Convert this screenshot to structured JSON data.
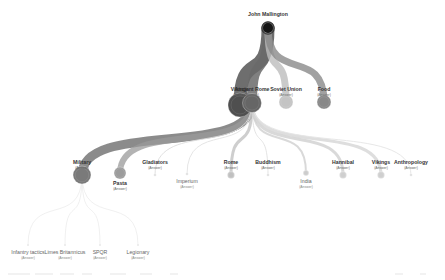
{
  "diagram": {
    "type": "tree",
    "root": {
      "name": "John Mallington",
      "x": 268,
      "y": 28,
      "r": 5,
      "label_y": 12,
      "color": "#151515"
    },
    "links": [
      {
        "from": "root",
        "to": "vikings_l1",
        "width": 13,
        "color": "#555555",
        "opacity": 0.85
      },
      {
        "from": "root",
        "to": "ancient_rome",
        "width": 10,
        "color": "#6a6a6a",
        "opacity": 0.85
      },
      {
        "from": "root",
        "to": "soviet_union",
        "width": 7,
        "color": "#bdbdbd",
        "opacity": 0.8
      },
      {
        "from": "root",
        "to": "food",
        "width": 7,
        "color": "#8a8a8a",
        "opacity": 0.8
      },
      {
        "from": "ancient_rome",
        "to": "military",
        "width": 9,
        "color": "#777777",
        "opacity": 0.85
      },
      {
        "from": "ancient_rome",
        "to": "pasta",
        "width": 6,
        "color": "#9a9a9a",
        "opacity": 0.75
      },
      {
        "from": "ancient_rome",
        "to": "gladiators",
        "width": 1,
        "color": "#dddddd",
        "opacity": 0.9
      },
      {
        "from": "ancient_rome",
        "to": "imperium",
        "width": 1,
        "color": "#e2e2e2",
        "opacity": 0.9
      },
      {
        "from": "ancient_rome",
        "to": "rome",
        "width": 3,
        "color": "#c2c2c2",
        "opacity": 0.8
      },
      {
        "from": "ancient_rome",
        "to": "buddhism",
        "width": 1,
        "color": "#e0e0e0",
        "opacity": 0.9
      },
      {
        "from": "ancient_rome",
        "to": "india",
        "width": 2,
        "color": "#d2d2d2",
        "opacity": 0.85
      },
      {
        "from": "ancient_rome",
        "to": "hannibal",
        "width": 3,
        "color": "#d0d0d0",
        "opacity": 0.8
      },
      {
        "from": "ancient_rome",
        "to": "vikings_l2",
        "width": 3,
        "color": "#d6d6d6",
        "opacity": 0.8
      },
      {
        "from": "ancient_rome",
        "to": "anthropology",
        "width": 1,
        "color": "#e4e4e4",
        "opacity": 0.9
      },
      {
        "from": "military",
        "to": "infantry_tactics",
        "width": 0.6,
        "color": "#e6e6e6",
        "opacity": 1
      },
      {
        "from": "military",
        "to": "limes_britannicus",
        "width": 0.6,
        "color": "#e6e6e6",
        "opacity": 1
      },
      {
        "from": "military",
        "to": "spqr",
        "width": 0.6,
        "color": "#e6e6e6",
        "opacity": 1
      },
      {
        "from": "military",
        "to": "legionary",
        "width": 0.6,
        "color": "#e6e6e6",
        "opacity": 1
      }
    ],
    "nodes": [
      {
        "id": "vikings_l1",
        "name": "Vikings",
        "status": "(Answer)",
        "x": 240,
        "y": 105,
        "r": 12,
        "color": "#4f4f4f",
        "label_y": 87,
        "faint": false
      },
      {
        "id": "ancient_rome",
        "name": "Ancient Rome",
        "status": "(Answer)",
        "x": 252,
        "y": 103,
        "r": 9.5,
        "color": "#666666",
        "label_y": 87,
        "faint": false
      },
      {
        "id": "soviet_union",
        "name": "Soviet Union",
        "status": "(Answer)",
        "x": 286,
        "y": 102,
        "r": 7,
        "color": "#c4c4c4",
        "label_y": 87,
        "faint": false
      },
      {
        "id": "food",
        "name": "Food",
        "status": "(Answer)",
        "x": 324,
        "y": 102,
        "r": 7,
        "color": "#888888",
        "label_y": 87,
        "faint": false
      },
      {
        "id": "military",
        "name": "Military",
        "status": "(Answer)",
        "x": 82,
        "y": 175,
        "r": 9,
        "color": "#7a7a7a",
        "label_y": 160,
        "faint": false
      },
      {
        "id": "pasta",
        "name": "Pasta",
        "status": "(Answer)",
        "x": 120,
        "y": 173,
        "r": 6,
        "color": "#9c9c9c",
        "label_y": 181,
        "faint": false,
        "label_below": true
      },
      {
        "id": "gladiators",
        "name": "Gladiators",
        "status": "(Answer)",
        "x": 155,
        "y": 175,
        "r": 1.3,
        "color": "#dddddd",
        "label_y": 160,
        "faint": false
      },
      {
        "id": "imperium",
        "name": "Imperium",
        "status": "(Answer)",
        "x": 187,
        "y": 174,
        "r": 1.3,
        "color": "#dddddd",
        "label_y": 179,
        "faint": true,
        "label_below": true
      },
      {
        "id": "rome",
        "name": "Rome",
        "status": "(Answer)",
        "x": 231,
        "y": 175,
        "r": 3.5,
        "color": "#c0c0c0",
        "label_y": 160,
        "faint": false
      },
      {
        "id": "buddhism",
        "name": "Buddhism",
        "status": "(Answer)",
        "x": 268,
        "y": 175,
        "r": 1.3,
        "color": "#dddddd",
        "label_y": 160,
        "faint": false
      },
      {
        "id": "india",
        "name": "India",
        "status": "(Answer)",
        "x": 306,
        "y": 173,
        "r": 2.8,
        "color": "#cccccc",
        "label_y": 179,
        "faint": true,
        "label_below": true
      },
      {
        "id": "hannibal",
        "name": "Hannibal",
        "status": "(Answer)",
        "x": 343,
        "y": 175,
        "r": 3.5,
        "color": "#cfcfcf",
        "label_y": 160,
        "faint": false
      },
      {
        "id": "vikings_l2",
        "name": "Vikings",
        "status": "(Answer)",
        "x": 381,
        "y": 175,
        "r": 3.5,
        "color": "#cfcfcf",
        "label_y": 160,
        "faint": false
      },
      {
        "id": "anthropology",
        "name": "Anthropology",
        "status": "(Answer)",
        "x": 411,
        "y": 175,
        "r": 1.3,
        "color": "#dddddd",
        "label_y": 160,
        "faint": false
      },
      {
        "id": "infantry_tactics",
        "name": "Infantry tactics",
        "status": "(Answer)",
        "x": 28,
        "y": 245,
        "r": 1,
        "color": "#e2e2e2",
        "label_y": 250,
        "faint": true,
        "label_below": true
      },
      {
        "id": "limes_britannicus",
        "name": "Limes Britannicus",
        "status": "(Answer)",
        "x": 65,
        "y": 245,
        "r": 1,
        "color": "#e2e2e2",
        "label_y": 250,
        "faint": true,
        "label_below": true
      },
      {
        "id": "spqr",
        "name": "SPQR",
        "status": "(Answer)",
        "x": 100,
        "y": 245,
        "r": 1,
        "color": "#e2e2e2",
        "label_y": 250,
        "faint": true,
        "label_below": true
      },
      {
        "id": "legionary",
        "name": "Legionary",
        "status": "(Answer)",
        "x": 138,
        "y": 245,
        "r": 1,
        "color": "#e2e2e2",
        "label_y": 250,
        "faint": true,
        "label_below": true
      }
    ]
  }
}
